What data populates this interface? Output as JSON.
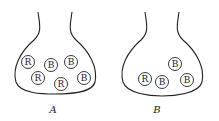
{
  "diagram": {
    "flasks": [
      {
        "label": "A",
        "balls": [
          "R",
          "B",
          "B",
          "R",
          "R",
          "B"
        ]
      },
      {
        "label": "B",
        "balls": [
          "B",
          "R",
          "B",
          "B"
        ]
      }
    ]
  }
}
